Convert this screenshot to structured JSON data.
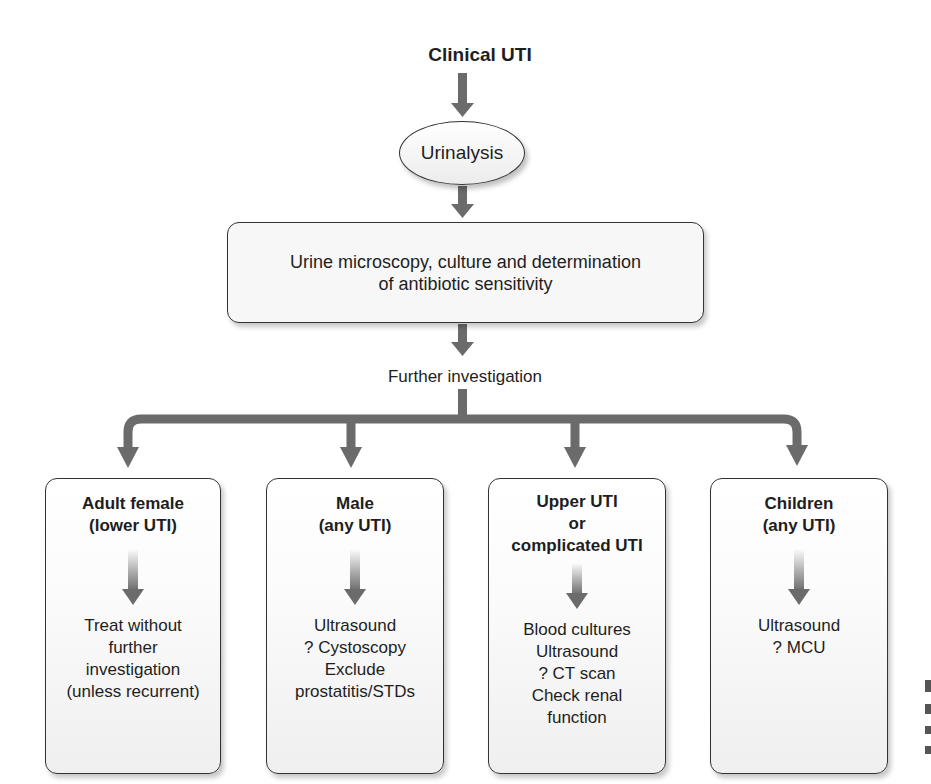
{
  "flowchart": {
    "start": {
      "label": "Clinical UTI"
    },
    "step1": {
      "label": "Urinalysis",
      "shape": "ellipse"
    },
    "step2": {
      "lines": [
        "Urine microscopy, culture and determination",
        "of antibiotic sensitivity"
      ],
      "shape": "rounded-rectangle"
    },
    "branch_label": "Further investigation",
    "branches": [
      {
        "heading": [
          "Adult female",
          "(lower UTI)"
        ],
        "actions": [
          "Treat without",
          "further",
          "investigation",
          "(unless recurrent)"
        ]
      },
      {
        "heading": [
          "Male",
          "(any UTI)"
        ],
        "actions": [
          "Ultrasound",
          "? Cystoscopy",
          "Exclude",
          "prostatitis/STDs"
        ]
      },
      {
        "heading": [
          "Upper UTI",
          "or",
          "complicated UTI"
        ],
        "actions": [
          "Blood cultures",
          "Ultrasound",
          "? CT scan",
          "Check renal",
          "function"
        ]
      },
      {
        "heading": [
          "Children",
          "(any UTI)"
        ],
        "actions": [
          "Ultrasound",
          "? MCU"
        ]
      }
    ]
  },
  "colors": {
    "arrow": "#6b6b6b",
    "border": "#333333",
    "text": "#1e1e1e"
  }
}
